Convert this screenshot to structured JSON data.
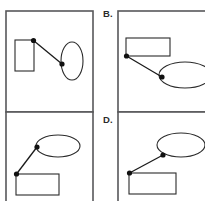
{
  "figure": {
    "title": "",
    "background_color": "#ffffff",
    "border_color": "#58585a",
    "shape_color": "#2b2b2b",
    "connector_color": "#1a1a1a",
    "node_color": "#111111",
    "width": 205,
    "height": 201
  },
  "labels": {
    "b": "B.",
    "d": "D."
  },
  "panels": [
    {
      "id": "panel-a",
      "label": "",
      "label_visible": false,
      "frame": {
        "x": 6,
        "y": 11,
        "w": 87,
        "h": 101
      },
      "shapes": [
        {
          "kind": "rectangle",
          "orientation": "vertical",
          "x": 15,
          "y": 40,
          "w": 19,
          "h": 31
        },
        {
          "kind": "ellipse",
          "orientation": "vertical",
          "cx": 72,
          "cy": 61,
          "rx": 11,
          "ry": 19
        }
      ],
      "connector": {
        "x1": 33.5,
        "y1": 40.5,
        "x2": 62,
        "y2": 64
      },
      "nodes": [
        {
          "cx": 33.5,
          "cy": 40.5,
          "r": 2.6,
          "anchor": "rectangle-top-right"
        },
        {
          "cx": 62,
          "cy": 64,
          "r": 2.6,
          "anchor": "ellipse-left"
        }
      ]
    },
    {
      "id": "panel-b",
      "label": "B.",
      "label_visible": true,
      "label_pos": {
        "x": 103,
        "y": 17
      },
      "frame": {
        "x": 118,
        "y": 11,
        "w": 95,
        "h": 101
      },
      "shapes": [
        {
          "kind": "rectangle",
          "orientation": "horizontal",
          "x": 126,
          "y": 38,
          "w": 44,
          "h": 18
        },
        {
          "kind": "ellipse",
          "orientation": "horizontal",
          "cx": 185,
          "cy": 75,
          "rx": 26,
          "ry": 13
        }
      ],
      "connector": {
        "x1": 126.5,
        "y1": 56,
        "x2": 162,
        "y2": 77
      },
      "nodes": [
        {
          "cx": 126.5,
          "cy": 56,
          "r": 2.6,
          "anchor": "rectangle-bottom-left"
        },
        {
          "cx": 162,
          "cy": 77,
          "r": 2.6,
          "anchor": "ellipse-left"
        }
      ]
    },
    {
      "id": "panel-c",
      "label": "",
      "label_visible": false,
      "frame": {
        "x": 6,
        "y": 112,
        "w": 87,
        "h": 101
      },
      "shapes": [
        {
          "kind": "ellipse",
          "orientation": "horizontal",
          "cx": 58,
          "cy": 146,
          "rx": 22,
          "ry": 11
        },
        {
          "kind": "rectangle",
          "orientation": "horizontal",
          "x": 16,
          "y": 174,
          "w": 43,
          "h": 21
        }
      ],
      "connector": {
        "x1": 16.5,
        "y1": 174,
        "x2": 37,
        "y2": 147
      },
      "nodes": [
        {
          "cx": 16.5,
          "cy": 174,
          "r": 2.6,
          "anchor": "rectangle-top-left"
        },
        {
          "cx": 37,
          "cy": 147,
          "r": 2.6,
          "anchor": "ellipse-left"
        }
      ]
    },
    {
      "id": "panel-d",
      "label": "D.",
      "label_visible": true,
      "label_pos": {
        "x": 103,
        "y": 123
      },
      "frame": {
        "x": 118,
        "y": 112,
        "w": 95,
        "h": 101
      },
      "shapes": [
        {
          "kind": "ellipse",
          "orientation": "horizontal",
          "cx": 181,
          "cy": 145,
          "rx": 24,
          "ry": 12
        },
        {
          "kind": "rectangle",
          "orientation": "horizontal",
          "x": 129,
          "y": 173,
          "w": 47,
          "h": 21
        }
      ],
      "connector": {
        "x1": 129.5,
        "y1": 173,
        "x2": 163,
        "y2": 155
      },
      "nodes": [
        {
          "cx": 129.5,
          "cy": 173,
          "r": 2.6,
          "anchor": "rectangle-top-left"
        },
        {
          "cx": 163,
          "cy": 155,
          "r": 2.6,
          "anchor": "ellipse-bottom-left"
        }
      ]
    }
  ]
}
